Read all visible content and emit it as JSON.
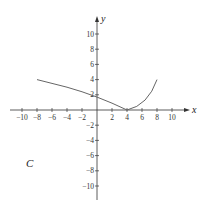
{
  "chart_data": {
    "type": "line",
    "title": "",
    "panel_label": "C",
    "xlabel": "x",
    "ylabel": "y",
    "xlim": [
      -11,
      11
    ],
    "ylim": [
      -11,
      11
    ],
    "x_ticks": [
      "-10",
      "-8",
      "-6",
      "-4",
      "-2",
      "2",
      "4",
      "6",
      "8",
      "10"
    ],
    "y_ticks": [
      "10",
      "8",
      "6",
      "4",
      "2",
      "-2",
      "-4",
      "-6",
      "-8",
      "-10"
    ],
    "grid": false,
    "series": [
      {
        "name": "curve",
        "x": [
          -8,
          -6,
          -4,
          -2,
          0,
          2,
          4,
          5,
          6,
          7,
          8
        ],
        "y": [
          4,
          3.5,
          3,
          2.4,
          1.7,
          0.9,
          0,
          0.4,
          1.0,
          2.0,
          4.0
        ]
      }
    ]
  }
}
